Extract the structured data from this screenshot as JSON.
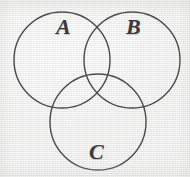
{
  "figure": {
    "kind": "venn-diagram",
    "width": 190,
    "height": 177,
    "background_color": "#ececeb",
    "stroke_color": "#4a4a4a",
    "label_color": "#3a3a3a",
    "stroke_width": 1.4,
    "caption": "Three overlapping circles forming a Venn diagram"
  },
  "sets": [
    {
      "id": "A",
      "label": "A",
      "position": "top-left",
      "center_x": 62,
      "center_y": 60,
      "radius": 48,
      "label_x": 56,
      "label_y": 16
    },
    {
      "id": "B",
      "label": "B",
      "position": "top-right",
      "center_x": 132,
      "center_y": 60,
      "radius": 48,
      "label_x": 126,
      "label_y": 16
    },
    {
      "id": "C",
      "label": "C",
      "position": "bottom-center",
      "center_x": 98,
      "center_y": 122,
      "radius": 48,
      "label_x": 89,
      "label_y": 141
    }
  ]
}
